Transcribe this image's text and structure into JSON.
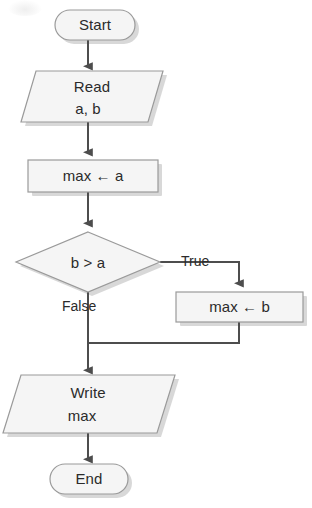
{
  "diagram": {
    "type": "flowchart",
    "nodes": [
      {
        "id": "start",
        "shape": "terminator",
        "label": "Start"
      },
      {
        "id": "read",
        "shape": "parallelogram",
        "label": "Read\na, b",
        "line1": "Read",
        "line2": "a, b"
      },
      {
        "id": "maxa",
        "shape": "process",
        "label": "max ← a"
      },
      {
        "id": "decision",
        "shape": "diamond",
        "label": "b > a"
      },
      {
        "id": "maxb",
        "shape": "process",
        "label": "max ← b"
      },
      {
        "id": "write",
        "shape": "parallelogram",
        "label": "Write\nmax",
        "line1": "Write",
        "line2": "max"
      },
      {
        "id": "end",
        "shape": "terminator",
        "label": "End"
      }
    ],
    "edges": [
      {
        "from": "start",
        "to": "read",
        "label": ""
      },
      {
        "from": "read",
        "to": "maxa",
        "label": ""
      },
      {
        "from": "maxa",
        "to": "decision",
        "label": ""
      },
      {
        "from": "decision",
        "to": "maxb",
        "label": "True"
      },
      {
        "from": "decision",
        "to": "write",
        "label": "False"
      },
      {
        "from": "maxb",
        "to": "write",
        "label": ""
      },
      {
        "from": "write",
        "to": "end",
        "label": ""
      }
    ],
    "edge_labels": {
      "true_label": "True",
      "false_label": "False"
    },
    "colors": {
      "shape_fill": "#f5f5f5",
      "shape_stroke": "#9a9a9a",
      "connector": "#4d4d4d",
      "text": "#2b2b2b",
      "shadow": "#cfcfcf",
      "background": "#ffffff"
    }
  }
}
